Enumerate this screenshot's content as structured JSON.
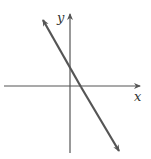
{
  "diagram": {
    "type": "coordinate-plane-line",
    "axes": {
      "x_label": "x",
      "y_label": "y"
    },
    "line": {
      "description": "straight line with negative slope, positive y-intercept, positive x-intercept, arrows at both ends",
      "color": "#555555"
    },
    "axis_color": "#555555"
  }
}
